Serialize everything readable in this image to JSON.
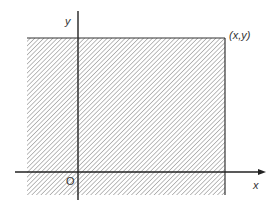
{
  "diagram": {
    "type": "coordinate-region",
    "labels": {
      "y_axis": "y",
      "x_axis": "x",
      "origin": "O",
      "corner_point": "(x,y)"
    },
    "colors": {
      "line": "#333333",
      "hatch": "#7a7a7a",
      "background": "#ffffff"
    }
  }
}
